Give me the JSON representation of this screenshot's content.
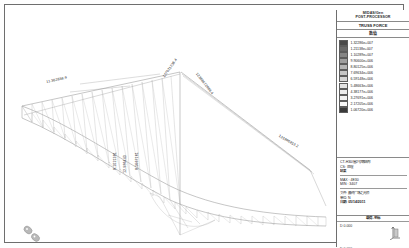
{
  "titleblock": {
    "program": "MIDAS/Gen",
    "module": "POST-PROCESSOR",
    "result_type": "TRUSS FORCE"
  },
  "legend": {
    "heading": "数值",
    "unit_note": "",
    "entries": [
      {
        "value": "1.32286e+007",
        "color": "#4a4a4a"
      },
      {
        "value": "1.21138e+007",
        "color": "#6a6a6a"
      },
      {
        "value": "1.10289e+007",
        "color": "#858585"
      },
      {
        "value": "9.90600e+006",
        "color": "#9e9e9e"
      },
      {
        "value": "8.80125e+006",
        "color": "#b4b4b4"
      },
      {
        "value": "7.69634e+006",
        "color": "#c6c6c6"
      },
      {
        "value": "6.59148e+006",
        "color": "#d6d6d6"
      },
      {
        "value": "5.48663e+006",
        "color": "#e2e2e2"
      },
      {
        "value": "4.38177e+006",
        "color": "#ececec"
      },
      {
        "value": "3.27691e+006",
        "color": "#f2f2f2"
      },
      {
        "value": "2.17205e+006",
        "color": "#f8f8f8"
      },
      {
        "value": "1.06720e+006",
        "color": "#3a3a3a"
      }
    ]
  },
  "info": {
    "project_line1": "CT-H30/屋2号钢结构",
    "project_line2": "CS: 处理",
    "label_result": "结果",
    "max_label": "MAX : 4E30",
    "min_label": "MIN : 3407",
    "file_label": "文件: 最终广场之光桥",
    "unit_label": "单位: N",
    "date_label": "日期: 05/14/2011"
  },
  "axisbox": {
    "title": "载荷-坐标",
    "top_value": "D  0.000",
    "bottom_value": "D  0.000"
  },
  "force_labels": [
    {
      "text": "11.362838.9",
      "x": 36,
      "y": 70,
      "rot": -12
    },
    {
      "text": "127021736.4",
      "x": 152,
      "y": 66,
      "rot": -55
    },
    {
      "text": "12388672889.4",
      "x": 188,
      "y": 62,
      "rot": 52
    },
    {
      "text": "131946813.2",
      "x": 270,
      "y": 124,
      "rot": 30
    },
    {
      "text": "8.1021381",
      "x": 103,
      "y": 128,
      "rot": -90
    },
    {
      "text": "12.986443",
      "x": 113,
      "y": 127,
      "rot": -90
    },
    {
      "text": "8.5667161",
      "x": 125,
      "y": 128,
      "rot": -90
    }
  ],
  "icons": {
    "axis_glyph": "axis-triad-icon",
    "watermark": "watermark-logo-icon"
  }
}
